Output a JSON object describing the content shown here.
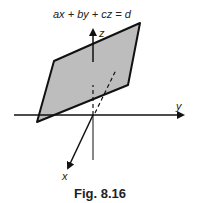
{
  "figure": {
    "equation": "ax + by + cz = d",
    "caption": "Fig. 8.16",
    "axes": {
      "x": "x",
      "y": "y",
      "z": "z"
    },
    "colors": {
      "plane_fill": "#bdbdbd",
      "stroke": "#111111"
    }
  }
}
